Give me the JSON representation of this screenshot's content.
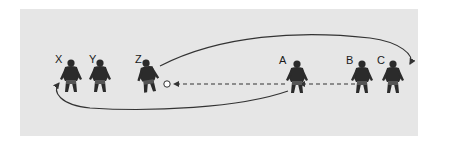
{
  "diagram": {
    "players": [
      {
        "id": "X",
        "label": "X",
        "team": "defense"
      },
      {
        "id": "Y",
        "label": "Y",
        "team": "defense"
      },
      {
        "id": "Z",
        "label": "Z",
        "team": "defense"
      },
      {
        "id": "A",
        "label": "A",
        "team": "attack"
      },
      {
        "id": "B",
        "label": "B",
        "team": "attack"
      },
      {
        "id": "C",
        "label": "C",
        "team": "attack"
      }
    ],
    "ball": {
      "label": "ball",
      "near": "Z"
    },
    "paths": [
      {
        "from": "B",
        "to": "A",
        "style": "dashed",
        "meaning": "pass"
      },
      {
        "from": "A",
        "to": "ball",
        "style": "dashed",
        "meaning": "pass"
      },
      {
        "from": "A",
        "to": "X",
        "style": "solid",
        "meaning": "run"
      },
      {
        "from": "Z",
        "to": "C",
        "style": "solid",
        "meaning": "run"
      }
    ],
    "colors": {
      "panel": "#e6e6e6",
      "figure": "#2b2b2b",
      "line": "#333333"
    }
  }
}
